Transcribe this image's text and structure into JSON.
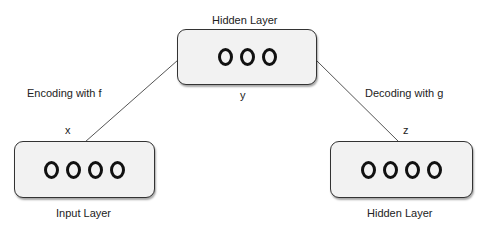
{
  "diagram": {
    "top_layer": {
      "title": "Hidden Layer",
      "variable": "y",
      "nodes": 3
    },
    "left_layer": {
      "title": "Input Layer",
      "variable": "x",
      "nodes": 4
    },
    "right_layer": {
      "title": "Hidden Layer",
      "variable": "z",
      "nodes": 4
    },
    "edges": [
      {
        "from": "left_layer",
        "to": "top_layer",
        "label": "Encoding with f"
      },
      {
        "from": "top_layer",
        "to": "right_layer",
        "label": "Decoding with g"
      }
    ]
  }
}
